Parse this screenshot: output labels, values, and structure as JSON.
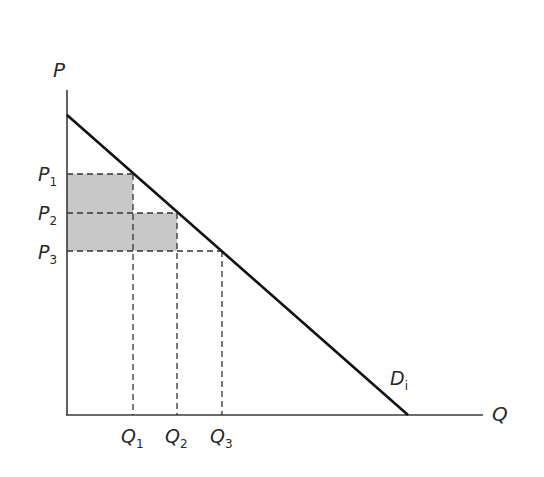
{
  "diagram": {
    "type": "demand-curve-price-discrimination",
    "axes": {
      "y_label": "P",
      "x_label": "Q"
    },
    "curve": {
      "label_main": "D",
      "label_sub": "i"
    },
    "price_levels": [
      {
        "main": "P",
        "sub": "1"
      },
      {
        "main": "P",
        "sub": "2"
      },
      {
        "main": "P",
        "sub": "3"
      }
    ],
    "quantity_levels": [
      {
        "main": "Q",
        "sub": "1"
      },
      {
        "main": "Q",
        "sub": "2"
      },
      {
        "main": "Q",
        "sub": "3"
      }
    ],
    "colors": {
      "axis": "#3a3a3a",
      "curve": "#111111",
      "shade": "#c8c8c8",
      "dash": "#333333"
    }
  }
}
